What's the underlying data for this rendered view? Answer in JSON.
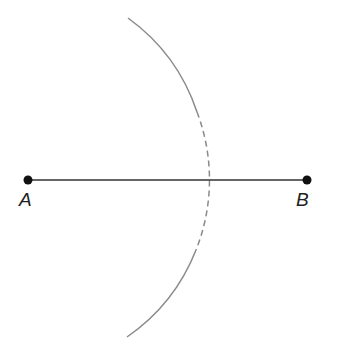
{
  "diagram": {
    "point_a": {
      "label": "A",
      "x": 28,
      "y": 180
    },
    "point_b": {
      "label": "B",
      "x": 307,
      "y": 180
    },
    "segment": {
      "from": "A",
      "to": "B",
      "color": "#333333"
    },
    "arc": {
      "center_x": 22,
      "center_y": 180,
      "radius": 190,
      "color": "#8a8a8a",
      "style": "solid ends, dashed middle"
    }
  }
}
